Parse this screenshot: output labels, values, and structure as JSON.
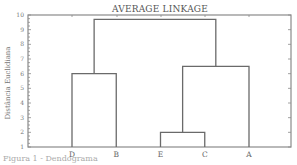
{
  "chart_data": {
    "type": "dendrogram",
    "title": "AVERAGE LINKAGE",
    "xlabel": "",
    "ylabel": "Distância Euclidiana",
    "ylim": [
      1,
      10
    ],
    "yticks": [
      1,
      2,
      3,
      4,
      5,
      6,
      7,
      8,
      9,
      10
    ],
    "leaves": [
      "D",
      "B",
      "E",
      "C",
      "A"
    ],
    "merges": [
      {
        "left": "E",
        "right": "C",
        "height": 2.0
      },
      {
        "left": "D",
        "right": "B",
        "height": 6.0
      },
      {
        "left": "E-C",
        "right": "A",
        "height": 6.5
      },
      {
        "left": "D-B",
        "right": "E-C-A",
        "height": 9.7
      }
    ],
    "grid": false,
    "legend": null
  },
  "caption": "Figura 1 - Dendograma"
}
